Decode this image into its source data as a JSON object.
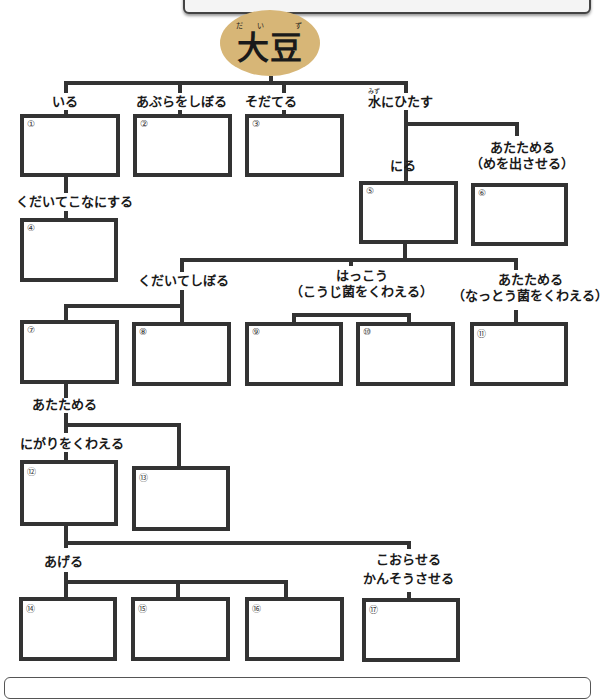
{
  "root": {
    "label": "大豆",
    "ruby": "だい ず",
    "color": "#d7b677"
  },
  "branches": {
    "iru": "いる",
    "abura": "あぶらをしぼる",
    "sodateru": "そだてる",
    "mizu": "水にひたす",
    "mizu_ruby": "みず",
    "kudaite_kona": "くだいてこなにする",
    "niru": "にる",
    "atatameru_me_1": "あたためる",
    "atatameru_me_2": "（めを出させる）",
    "kudaite_shiboru": "くだいてしぼる",
    "hakkou_1": "はっこう",
    "hakkou_2": "（こうじ菌をくわえる）",
    "natto_1": "あたためる",
    "natto_2": "（なっとう菌をくわえる）",
    "atatameru": "あたためる",
    "nigari": "にがりをくわえる",
    "ageru": "あげる",
    "koraseru_1": "こおらせる",
    "koraseru_2": "かんそうさせる"
  },
  "boxes": [
    "①",
    "②",
    "③",
    "④",
    "⑤",
    "⑥",
    "⑦",
    "⑧",
    "⑨",
    "⑩",
    "⑪",
    "⑫",
    "⑬",
    "⑭",
    "⑮",
    "⑯",
    "⑰"
  ]
}
